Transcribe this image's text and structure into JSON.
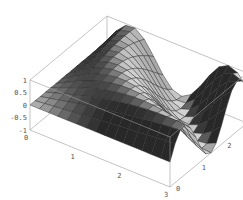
{
  "chart_data": {
    "type": "surface3d",
    "title": "",
    "function": "sin(x*y)",
    "x_range": [
      0,
      3
    ],
    "y_range": [
      0,
      3
    ],
    "z_range": [
      -1,
      1
    ],
    "grid_divisions": 15,
    "x_ticks": [
      "0",
      "1",
      "2",
      "3"
    ],
    "y_ticks": [
      "0",
      "1",
      "2",
      "3"
    ],
    "z_ticks": [
      "-1",
      "-0.5",
      "0",
      "0.5",
      "1"
    ],
    "xlabel": "",
    "ylabel": "",
    "zlabel": "",
    "boxed": true,
    "surface_color": "#8c8c8c",
    "mesh_color": "#2a2a2a",
    "box_color": "#9a9a9a"
  }
}
